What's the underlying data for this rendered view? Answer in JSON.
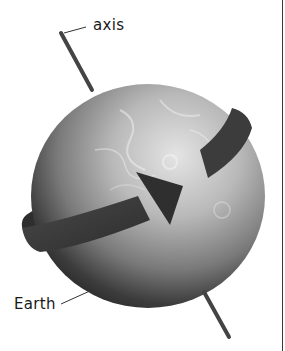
{
  "diagram": {
    "labels": {
      "axis": "axis",
      "earth": "Earth"
    },
    "elements": {
      "globe": "earth-globe",
      "rotation_arrow": "rotation-direction-arrow",
      "axis_line": "rotation-axis"
    },
    "colors": {
      "background": "#ffffff",
      "arrow": "#3a3a3a",
      "axis": "#444444",
      "text": "#1a1a1a",
      "globe_light": "#d8d8d8",
      "globe_dark": "#2a2a2a"
    }
  }
}
